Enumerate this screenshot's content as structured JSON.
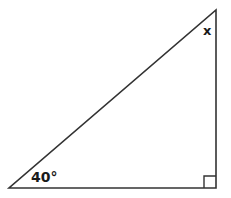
{
  "diagram": {
    "type": "right-triangle",
    "stroke_color": "#333333",
    "background_color": "#ffffff",
    "vertices": {
      "bottom_left": [
        9,
        188
      ],
      "bottom_right": [
        216,
        188
      ],
      "top_right": [
        216,
        10
      ]
    },
    "right_angle_marker_size": 12,
    "labels": {
      "known_angle": "40°",
      "unknown_angle": "x"
    }
  }
}
